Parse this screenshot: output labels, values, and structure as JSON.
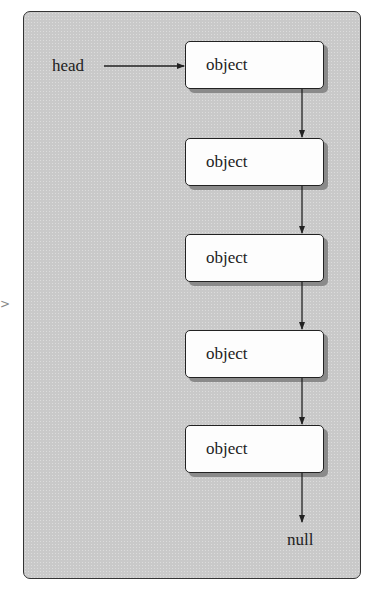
{
  "diagram": {
    "type": "singly-linked-list",
    "head_label": "head",
    "nodes": [
      {
        "label": "object"
      },
      {
        "label": "object"
      },
      {
        "label": "object"
      },
      {
        "label": "object"
      },
      {
        "label": "object"
      }
    ],
    "terminal_label": "null",
    "edge_bleed_glyph": ">"
  },
  "colors": {
    "panel_fill": "#c9c9c9",
    "node_fill": "#fdfdfd",
    "border": "#222222",
    "shadow": "#8a8a8a"
  }
}
